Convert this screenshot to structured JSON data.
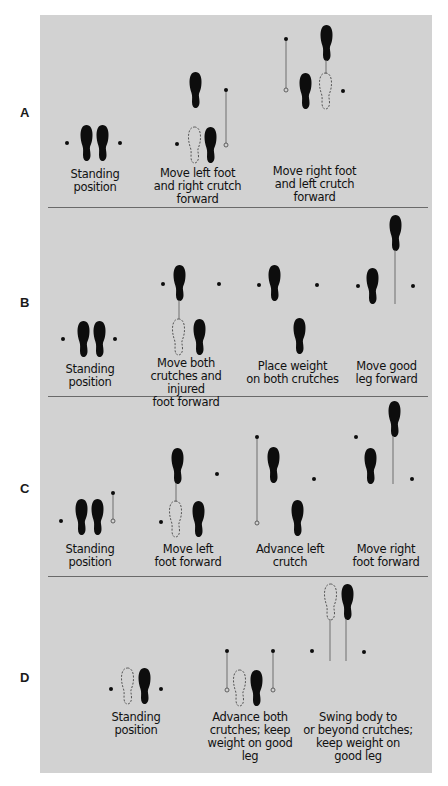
{
  "figure": {
    "background_color": "#d2d2d2",
    "ink_color": "#0d0d0d",
    "crutch_line_color": "#6e6e6e"
  },
  "rows": [
    {
      "label": "A",
      "steps": [
        {
          "caption": "Standing position",
          "lines": [
            "Standing",
            "position"
          ]
        },
        {
          "caption": "Move left foot and right crutch forward",
          "lines": [
            "Move left foot",
            "and right crutch",
            "forward"
          ]
        },
        {
          "caption": "Move right foot and left crutch forward",
          "lines": [
            "Move right foot",
            "and left crutch",
            "forward"
          ]
        }
      ]
    },
    {
      "label": "B",
      "steps": [
        {
          "caption": "Standing position",
          "lines": [
            "Standing",
            "position"
          ]
        },
        {
          "caption": "Move both crutches and injured foot forward",
          "lines": [
            "Move both",
            "crutches and injured",
            "foot forward"
          ]
        },
        {
          "caption": "Place weight on both crutches",
          "lines": [
            "Place weight",
            "on both crutches"
          ]
        },
        {
          "caption": "Move good leg forward",
          "lines": [
            "Move good",
            "leg forward"
          ]
        }
      ]
    },
    {
      "label": "C",
      "steps": [
        {
          "caption": "Standing position",
          "lines": [
            "Standing",
            "position"
          ]
        },
        {
          "caption": "Move left foot forward",
          "lines": [
            "Move left",
            "foot forward"
          ]
        },
        {
          "caption": "Advance left crutch",
          "lines": [
            "Advance left",
            "crutch"
          ]
        },
        {
          "caption": "Move right foot forward",
          "lines": [
            "Move right",
            "foot forward"
          ]
        }
      ]
    },
    {
      "label": "D",
      "steps": [
        {
          "caption": "Standing position",
          "lines": [
            "Standing",
            "position"
          ]
        },
        {
          "caption": "Advance both crutches; keep weight on good leg",
          "lines": [
            "Advance both",
            "crutches; keep",
            "weight on good",
            "leg"
          ]
        },
        {
          "caption": "Swing body to or beyond crutches; keep weight on good leg",
          "lines": [
            "Swing body to",
            "or beyond crutches;",
            "keep weight on",
            "good leg"
          ]
        }
      ]
    }
  ]
}
